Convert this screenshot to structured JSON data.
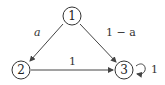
{
  "diagram": {
    "type": "markov-chain-state-diagram",
    "nodes": [
      {
        "id": "1",
        "label": "1"
      },
      {
        "id": "2",
        "label": "2"
      },
      {
        "id": "3",
        "label": "3"
      }
    ],
    "edges": [
      {
        "from": "1",
        "to": "2",
        "label": "a"
      },
      {
        "from": "1",
        "to": "3",
        "label": "1 − a"
      },
      {
        "from": "2",
        "to": "3",
        "label": "1"
      },
      {
        "from": "3",
        "to": "3",
        "label": "1"
      }
    ],
    "colors": {
      "stroke": "#333333",
      "background": "#ffffff"
    }
  }
}
